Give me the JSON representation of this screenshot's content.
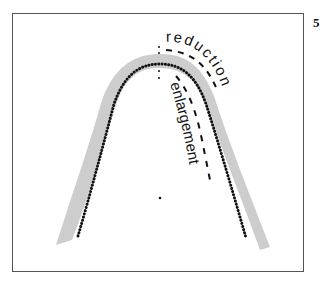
{
  "figure": {
    "page_number": "5",
    "labels": {
      "reduction": "reduction",
      "enlargement": "enlargement"
    },
    "colors": {
      "band": "#c8c8c8",
      "dots": "#111111",
      "frame": "#555555",
      "dashes": "#111111"
    }
  }
}
